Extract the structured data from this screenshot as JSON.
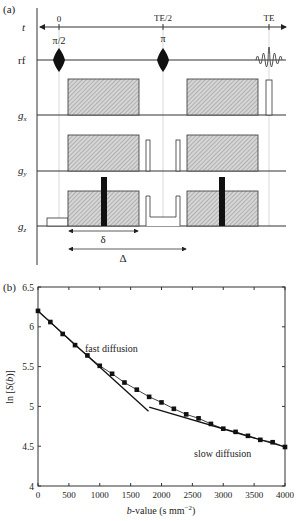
{
  "panel_a": {
    "label": "(a)",
    "row_labels": {
      "t": "t",
      "rf": "rf",
      "gx": "g",
      "gx_sub": "x",
      "gy": "g",
      "gy_sub": "y",
      "gz": "g",
      "gz_sub": "z"
    },
    "time_labels": {
      "zero": "0",
      "half": "TE/2",
      "echo": "TE"
    },
    "pulse_labels": {
      "excite": "π/2",
      "refocus": "π"
    },
    "dimension_labels": {
      "delta_small": "δ",
      "delta_big": "Δ"
    },
    "colors": {
      "line": "#333333",
      "hatch": "#9a9a9a",
      "bar": "#111111",
      "guide": "#cfcfcf"
    }
  },
  "panel_b": {
    "label": "(b)",
    "annotations": {
      "fast": "fast diffusion",
      "slow": "slow diffusion"
    }
  },
  "chart_data": {
    "type": "line",
    "title": "",
    "xlabel": "b-value (s mm^-2)",
    "ylabel": "ln [S(b)]",
    "xlim": [
      0,
      4000
    ],
    "ylim": [
      4,
      6.5
    ],
    "xticks": [
      0,
      500,
      1000,
      1500,
      2000,
      2500,
      3000,
      3500,
      4000
    ],
    "yticks": [
      4,
      4.5,
      5,
      5.5,
      6,
      6.5
    ],
    "grid": false,
    "series": [
      {
        "name": "measured ln S(b)",
        "marker": "square",
        "x": [
          0,
          200,
          400,
          600,
          800,
          1000,
          1200,
          1400,
          1600,
          1800,
          2000,
          2200,
          2400,
          2600,
          2800,
          3000,
          3200,
          3400,
          3600,
          3800,
          4000
        ],
        "values": [
          6.2,
          6.06,
          5.91,
          5.77,
          5.64,
          5.51,
          5.41,
          5.3,
          5.21,
          5.12,
          5.05,
          4.97,
          4.9,
          4.85,
          4.78,
          4.72,
          4.68,
          4.63,
          4.58,
          4.55,
          4.49
        ]
      },
      {
        "name": "fast diffusion fit",
        "marker": "none",
        "x": [
          0,
          1790
        ],
        "values": [
          6.2,
          4.94
        ]
      },
      {
        "name": "slow diffusion fit",
        "marker": "none",
        "x": [
          1800,
          4000
        ],
        "values": [
          4.99,
          4.49
        ]
      }
    ],
    "annotations": [
      {
        "text": "fast diffusion",
        "x": 1000,
        "y": 5.8
      },
      {
        "text": "slow diffusion",
        "x": 2900,
        "y": 4.36
      }
    ]
  }
}
